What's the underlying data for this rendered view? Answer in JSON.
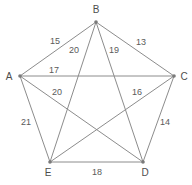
{
  "figure": {
    "type": "complete-graph-k5-pentagram",
    "background_color": "#ffffff",
    "edge_color": "#8c8c8c",
    "vertex_color": "#7a7a7a",
    "label_color": "#4d4d4d",
    "width": 192,
    "height": 185
  },
  "vertices": [
    {
      "id": "B",
      "label": "B",
      "x": 96,
      "y": 22,
      "label_x": 96,
      "label_y": 10
    },
    {
      "id": "A",
      "label": "A",
      "x": 20,
      "y": 76,
      "label_x": 9,
      "label_y": 77
    },
    {
      "id": "C",
      "label": "C",
      "x": 174,
      "y": 76,
      "label_x": 184,
      "label_y": 77
    },
    {
      "id": "E",
      "label": "E",
      "x": 50,
      "y": 162,
      "label_x": 48,
      "label_y": 173
    },
    {
      "id": "D",
      "label": "D",
      "x": 143,
      "y": 162,
      "label_x": 145,
      "label_y": 173
    }
  ],
  "edges": [
    {
      "from": "A",
      "to": "B",
      "weight": "15",
      "label_x": 55,
      "label_y": 41
    },
    {
      "from": "B",
      "to": "C",
      "weight": "13",
      "label_x": 141,
      "label_y": 42
    },
    {
      "from": "A",
      "to": "C",
      "weight": "17",
      "label_x": 54,
      "label_y": 70
    },
    {
      "from": "A",
      "to": "E",
      "weight": "21",
      "label_x": 26,
      "label_y": 122
    },
    {
      "from": "E",
      "to": "D",
      "weight": "18",
      "label_x": 97,
      "label_y": 172
    },
    {
      "from": "D",
      "to": "C",
      "weight": "14",
      "label_x": 165,
      "label_y": 122
    },
    {
      "from": "B",
      "to": "E",
      "weight": "20",
      "label_x": 74,
      "label_y": 50
    },
    {
      "from": "B",
      "to": "D",
      "weight": "19",
      "label_x": 114,
      "label_y": 50
    },
    {
      "from": "A",
      "to": "D",
      "weight": "20",
      "label_x": 57,
      "label_y": 92
    },
    {
      "from": "E",
      "to": "C",
      "weight": "16",
      "label_x": 137,
      "label_y": 92
    }
  ]
}
